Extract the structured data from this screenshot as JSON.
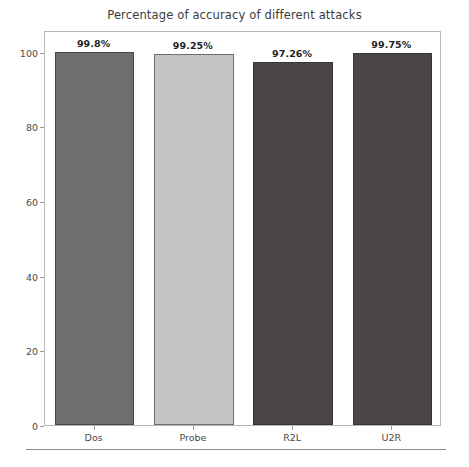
{
  "chart_data": {
    "type": "bar",
    "title": "Percentage of accuracy of different attacks",
    "xlabel": "",
    "ylabel": "",
    "categories": [
      "Dos",
      "Probe",
      "R2L",
      "U2R"
    ],
    "values": [
      99.8,
      99.25,
      97.26,
      99.75
    ],
    "value_labels": [
      "99.8%",
      "99.25%",
      "97.26%",
      "99.75%"
    ],
    "bar_colors": [
      "#6e6e6e",
      "#c4c4c4",
      "#4a4548",
      "#4a4548"
    ],
    "ylim": [
      0,
      105.8
    ],
    "yticks": [
      0,
      20,
      40,
      60,
      80,
      100
    ],
    "ytick_labels": [
      "0",
      "20",
      "40",
      "60",
      "80",
      "100"
    ],
    "grid": false,
    "legend": "none"
  },
  "figure": {
    "frame_color": "#b7b7b7",
    "background": "#ffffff",
    "text_color": "#3b3b3b"
  }
}
